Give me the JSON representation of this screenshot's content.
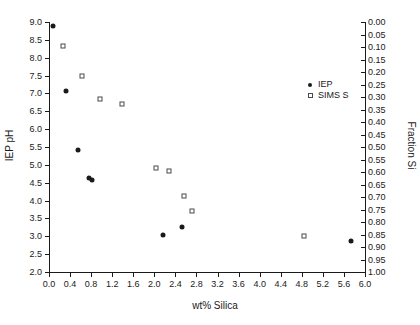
{
  "chart_data": {
    "type": "scatter",
    "title": "",
    "xlabel": "wt% Silica",
    "ylabel": "IEP pH",
    "y2label": "Fraction Si",
    "xlim": [
      0.0,
      6.0
    ],
    "ylim": [
      2.0,
      9.0
    ],
    "y2lim": [
      0.0,
      1.0
    ],
    "y2_inverted": true,
    "grid": false,
    "legend_position": "right-inside",
    "xticks": [
      "0.0",
      "0.4",
      "0.8",
      "1.2",
      "1.6",
      "2.0",
      "2.4",
      "2.8",
      "3.2",
      "3.6",
      "4.0",
      "4.4",
      "4.8",
      "5.2",
      "5.6",
      "6.0"
    ],
    "xtick_values": [
      0.0,
      0.4,
      0.8,
      1.2,
      1.6,
      2.0,
      2.4,
      2.8,
      3.2,
      3.6,
      4.0,
      4.4,
      4.8,
      5.2,
      5.6,
      6.0
    ],
    "yticks": [
      "9.0",
      "8.5",
      "8.0",
      "7.5",
      "7.0",
      "6.5",
      "6.0",
      "5.5",
      "5.0",
      "4.5",
      "4.0",
      "3.5",
      "3.0",
      "2.5",
      "2.0"
    ],
    "ytick_values": [
      9.0,
      8.5,
      8.0,
      7.5,
      7.0,
      6.5,
      6.0,
      5.5,
      5.0,
      4.5,
      4.0,
      3.5,
      3.0,
      2.5,
      2.0
    ],
    "y2ticks": [
      "0.00",
      "0.05",
      "0.10",
      "0.15",
      "0.20",
      "0.25",
      "0.30",
      "0.35",
      "0.40",
      "0.45",
      "0.50",
      "0.55",
      "0.60",
      "0.65",
      "0.70",
      "0.75",
      "0.80",
      "0.85",
      "0.90",
      "0.95",
      "1.00"
    ],
    "y2tick_values": [
      0.0,
      0.05,
      0.1,
      0.15,
      0.2,
      0.25,
      0.3,
      0.35,
      0.4,
      0.45,
      0.5,
      0.55,
      0.6,
      0.65,
      0.7,
      0.75,
      0.8,
      0.85,
      0.9,
      0.95,
      1.0
    ],
    "series": [
      {
        "name": "IEP",
        "marker": "filled-circle",
        "color": "#1a1a1a",
        "axis": "left",
        "points": [
          {
            "x": 0.07,
            "y": 8.9
          },
          {
            "x": 0.33,
            "y": 7.07
          },
          {
            "x": 0.55,
            "y": 5.43
          },
          {
            "x": 0.76,
            "y": 4.64
          },
          {
            "x": 0.82,
            "y": 4.57
          },
          {
            "x": 2.17,
            "y": 3.03
          },
          {
            "x": 2.52,
            "y": 3.27
          },
          {
            "x": 5.73,
            "y": 2.88
          }
        ]
      },
      {
        "name": "SIMS S",
        "marker": "open-square",
        "color": "#4a4a4a",
        "axis": "right",
        "points": [
          {
            "x": 0.26,
            "y": 8.32
          },
          {
            "x": 0.62,
            "y": 7.5
          },
          {
            "x": 0.97,
            "y": 6.84
          },
          {
            "x": 1.38,
            "y": 6.7
          },
          {
            "x": 2.03,
            "y": 4.91
          },
          {
            "x": 2.28,
            "y": 4.83
          },
          {
            "x": 2.57,
            "y": 4.14
          },
          {
            "x": 2.72,
            "y": 3.72
          },
          {
            "x": 4.85,
            "y": 3.02
          }
        ]
      }
    ],
    "legend": [
      {
        "label": "IEP",
        "marker": "filled-circle"
      },
      {
        "label": "SIMS S",
        "marker": "open-square"
      }
    ]
  }
}
